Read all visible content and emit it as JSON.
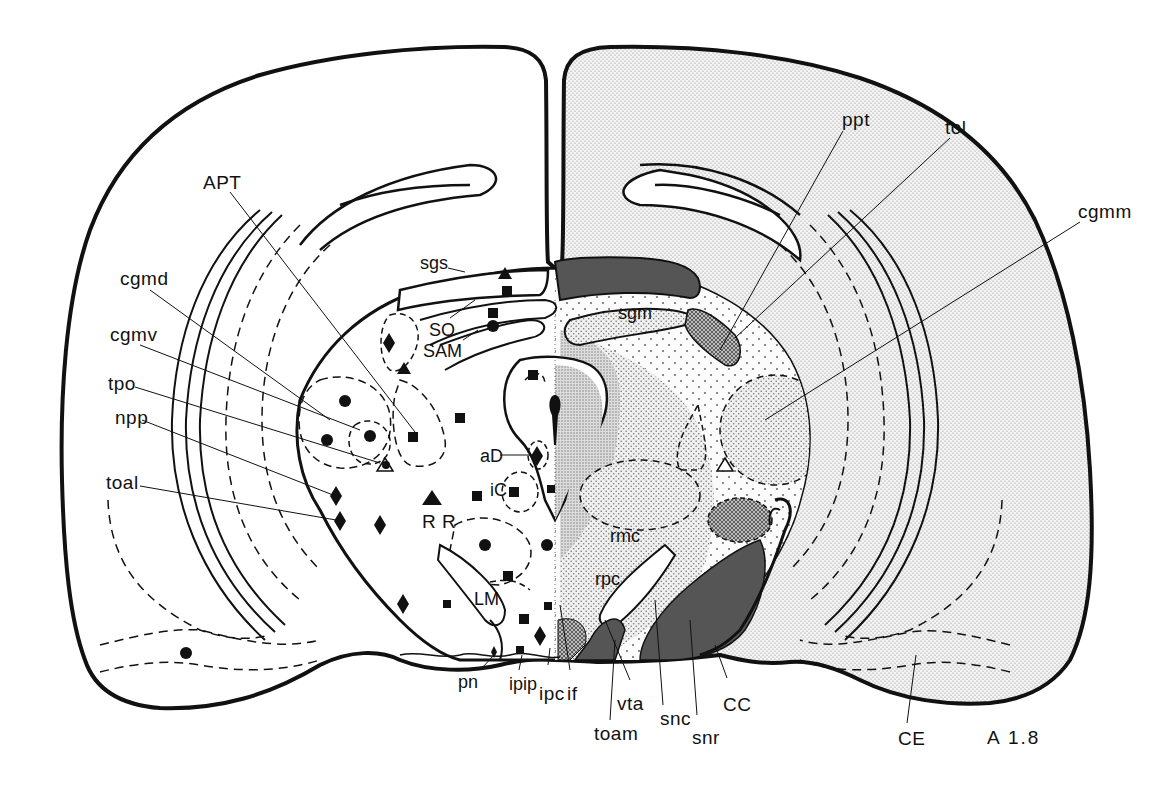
{
  "figure": {
    "type": "coronal brain section atlas plate",
    "plate_label": "A 1.8",
    "colors": {
      "outline": "#111111",
      "light_stipple": "#e6e6e6",
      "medium_stipple": "#cfcfcf",
      "dense_stipple": "#b8b8b8",
      "crosshatch": "#9a9a9a",
      "dark_fill": "#555555",
      "background": "#ffffff"
    },
    "labels": {
      "left": {
        "APT": "APT",
        "cgmd": "cgmd",
        "cgmv": "cgmv",
        "tpo": "tpo",
        "npp": "npp",
        "toal": "toal"
      },
      "center": {
        "sgs": "sgs",
        "SO": "SO",
        "SAM": "SAM",
        "aD": "aD",
        "iC": "iC",
        "RR": "R R",
        "LM": "LM",
        "rmc": "rmc",
        "rpc": "rpc",
        "sgm": "sgm"
      },
      "right": {
        "ppt": "ppt",
        "tol": "tol",
        "cgmm": "cgmm"
      },
      "bottom": {
        "pn": "pn",
        "ipip": "ipip",
        "ipc": "ipc",
        "if": "if",
        "vta": "vta",
        "toam": "toam",
        "snc": "snc",
        "snr": "snr",
        "CC": "CC",
        "CE": "CE"
      }
    },
    "markers": {
      "circles": [
        [
          186,
          653
        ],
        [
          345,
          401
        ],
        [
          370,
          436
        ],
        [
          327,
          440
        ],
        [
          493,
          326
        ],
        [
          485,
          545
        ],
        [
          547,
          545
        ]
      ],
      "squares": [
        [
          507,
          291
        ],
        [
          493,
          313
        ],
        [
          533,
          375
        ],
        [
          460,
          418
        ],
        [
          413,
          437
        ],
        [
          477,
          496
        ],
        [
          514,
          492
        ],
        [
          551,
          489
        ],
        [
          508,
          576
        ],
        [
          447,
          604
        ],
        [
          548,
          606
        ],
        [
          524,
          619
        ],
        [
          520,
          650
        ]
      ],
      "diamonds": [
        [
          389,
          343
        ],
        [
          336,
          496
        ],
        [
          340,
          521
        ],
        [
          380,
          525
        ],
        [
          403,
          604
        ],
        [
          537,
          456
        ],
        [
          540,
          636
        ],
        [
          494,
          652
        ]
      ],
      "triangles_filled": [
        [
          505,
          274
        ],
        [
          404,
          369
        ],
        [
          432,
          499
        ]
      ],
      "triangles_open": [
        [
          385,
          466
        ],
        [
          725,
          466
        ]
      ]
    }
  }
}
